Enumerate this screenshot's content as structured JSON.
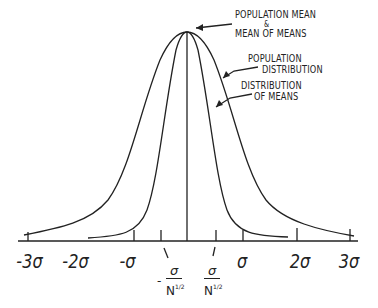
{
  "diagram": {
    "annotations": {
      "population_mean": [
        "POPULATION MEAN",
        "&",
        "MEAN OF MEANS"
      ],
      "population_distribution": [
        "POPULATION",
        "DISTRIBUTION"
      ],
      "distribution_of_means": [
        "DISTRIBUTION",
        "OF MEANS"
      ]
    },
    "axis_ticks": {
      "neg3": "-3σ",
      "neg2": "-2σ",
      "neg1": "-σ",
      "pos1": "σ",
      "pos2": "2σ",
      "pos3": "3σ"
    },
    "fraction_labels": {
      "neg": {
        "sign": "-",
        "numerator": "σ",
        "denominator": "N",
        "exponent": "1/2"
      },
      "pos": {
        "sign": "",
        "numerator": "σ",
        "denominator": "N",
        "exponent": "1/2"
      }
    },
    "colors": {
      "ink": "#222222",
      "background": "#ffffff"
    }
  }
}
